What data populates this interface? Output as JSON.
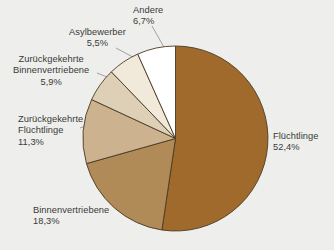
{
  "chart_data": {
    "type": "pie",
    "title": "",
    "subtitle": "",
    "xlabel": "",
    "ylabel": "",
    "legend_position": "none",
    "grid": false,
    "value_unit": "%",
    "decimal_separator": ",",
    "start_angle_deg": 0,
    "direction": "clockwise",
    "categories": [
      "Flüchtlinge",
      "Binnenvertriebene",
      "Zurückgekehrte Flüchtlinge",
      "Zurückgekehrte Binnenvertriebene",
      "Asylbewerber",
      "Andere"
    ],
    "values": [
      52.4,
      18.3,
      11.3,
      5.9,
      5.5,
      6.7
    ],
    "value_labels": [
      "52,4%",
      "18,3%",
      "11,3%",
      "5,9%",
      "5,5%",
      "6,7%"
    ],
    "colors": [
      "#a06a2c",
      "#b08a57",
      "#ccb28e",
      "#ded0b7",
      "#f1e9da",
      "#ffffff"
    ],
    "slices": [
      {
        "label": "Flüchtlinge",
        "label_lines": [
          "Flüchtlinge"
        ],
        "value": 52.4,
        "value_label": "52,4%",
        "color": "#a06a2c"
      },
      {
        "label": "Binnenvertriebene",
        "label_lines": [
          "Binnenvertriebene"
        ],
        "value": 18.3,
        "value_label": "18,3%",
        "color": "#b08a57"
      },
      {
        "label": "Zurückgekehrte Flüchtlinge",
        "label_lines": [
          "Zurückgekehrte",
          "Flüchtlinge"
        ],
        "value": 11.3,
        "value_label": "11,3%",
        "color": "#ccb28e"
      },
      {
        "label": "Zurückgekehrte Binnenvertriebene",
        "label_lines": [
          "Zurückgekehrte",
          "Binnenvertriebene"
        ],
        "value": 5.9,
        "value_label": "5,9%",
        "color": "#ded0b7"
      },
      {
        "label": "Asylbewerber",
        "label_lines": [
          "Asylbewerber"
        ],
        "value": 5.5,
        "value_label": "5,5%",
        "color": "#f1e9da"
      },
      {
        "label": "Andere",
        "label_lines": [
          "Andere"
        ],
        "value": 6.7,
        "value_label": "6,7%",
        "color": "#ffffff"
      }
    ]
  },
  "style": {
    "background": "#eeeeec",
    "slice_outline": "#4b3a24",
    "leader_line": "#8c8c88",
    "text_color": "#3a3a38"
  },
  "labels": {
    "fluechtlinge": {
      "line1": "Flüchtlinge",
      "value": "52,4%"
    },
    "binnenvertriebene": {
      "line1": "Binnenvertriebene",
      "value": "18,3%"
    },
    "zg_fluechtlinge": {
      "line1": "Zurückgekehrte",
      "line2": "Flüchtlinge",
      "value": "11,3%"
    },
    "zg_binnenvertriebene": {
      "line1": "Zurückgekehrte",
      "line2": "Binnenvertriebene",
      "value": "5,9%"
    },
    "asylbewerber": {
      "line1": "Asylbewerber",
      "value": "5,5%"
    },
    "andere": {
      "line1": "Andere",
      "value": "6,7%"
    }
  }
}
